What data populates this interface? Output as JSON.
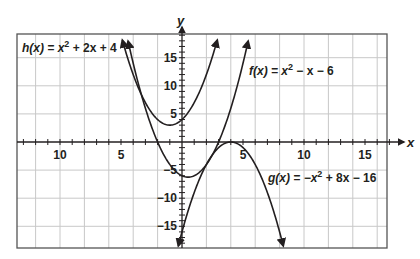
{
  "chart_data": {
    "type": "line",
    "title": "",
    "xlabel": "x",
    "ylabel": "y",
    "xlim": [
      -13.4,
      16.9
    ],
    "ylim": [
      -18.8,
      19.2
    ],
    "grid": true,
    "grid_spacing": {
      "x": 2,
      "y": 5
    },
    "x_ticks": {
      "step": 1,
      "labels": [
        {
          "value": -10,
          "text": "10"
        },
        {
          "value": -5,
          "text": "5"
        },
        {
          "value": 5,
          "text": "5"
        },
        {
          "value": 10,
          "text": "10"
        },
        {
          "value": 15,
          "text": "15"
        }
      ]
    },
    "y_ticks": {
      "step": 1,
      "labels": [
        {
          "value": 15,
          "text": "15"
        },
        {
          "value": 10,
          "text": "10"
        },
        {
          "value": 5,
          "text": "5"
        },
        {
          "value": -5,
          "text": "−5"
        },
        {
          "value": -10,
          "text": "−10"
        },
        {
          "value": -15,
          "text": "−15"
        }
      ]
    },
    "series": [
      {
        "name": "h(x) = x² + 2x + 4",
        "coefficients": [
          1,
          2,
          4
        ],
        "x_range": [
          -4.89,
          2.89
        ],
        "vertex": [
          -1,
          3
        ],
        "label": {
          "prefix": "h(x) = x",
          "sup": "2",
          "suffix": " + 2x + 4"
        }
      },
      {
        "name": "f(x) = x² − x − 6",
        "coefficients": [
          1,
          -1,
          -6
        ],
        "x_range": [
          -4.42,
          5.42
        ],
        "vertex": [
          0.5,
          -6.25
        ],
        "label": {
          "prefix": "f(x) = x",
          "sup": "2",
          "suffix": " − x − 6"
        }
      },
      {
        "name": "g(x) = −x² + 8x − 16",
        "coefficients": [
          -1,
          8,
          -16
        ],
        "x_range": [
          -0.3,
          8.3
        ],
        "vertex": [
          4,
          0
        ],
        "label": {
          "prefix": "g(x) = −x",
          "sup": "2",
          "suffix": " + 8x − 16"
        }
      }
    ]
  },
  "axes": {
    "x_name": "x",
    "y_name": "y"
  },
  "colors": {
    "curve": "#231f20",
    "grid": "#c8c8c8",
    "frame": "#555555",
    "axis": "#231f20"
  }
}
